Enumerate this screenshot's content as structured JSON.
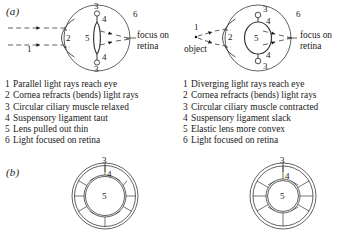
{
  "figure": {
    "panels": {
      "a": {
        "label": "(a)"
      },
      "b": {
        "label": "(b)"
      }
    }
  },
  "diagrams": {
    "eye_relaxed": {
      "name": "distant-vision-eye",
      "annotations": {
        "ray_label": "1",
        "cornea_label": "2",
        "ciliary_top_label": "3",
        "ciliary_bottom_label": "3",
        "ligament_top_label": "4",
        "ligament_bottom_label": "4",
        "lens_label": "5",
        "retina_label": "6"
      },
      "focus_text_line1": "focus on",
      "focus_text_line2": "retina"
    },
    "eye_accommodated": {
      "name": "near-vision-eye",
      "annotations": {
        "ray_label": "1",
        "cornea_label": "2",
        "ciliary_top_label": "3",
        "ciliary_bottom_label": "3",
        "ligament_top_label": "4",
        "ligament_bottom_label": "4",
        "lens_label": "5",
        "retina_label": "6"
      },
      "object_text": "object",
      "focus_text_line1": "focus on",
      "focus_text_line2": "retina"
    },
    "ciliary_relaxed": {
      "name": "ciliary-ring-relaxed",
      "annotations": {
        "muscle_label": "3",
        "ligament_label": "4",
        "lens_label": "5"
      }
    },
    "ciliary_contracted": {
      "name": "ciliary-ring-contracted",
      "annotations": {
        "muscle_label": "3",
        "ligament_label": "4",
        "lens_label": "5"
      }
    }
  },
  "captions": {
    "left": [
      {
        "num": "1",
        "text": "Parallel light rays reach eye"
      },
      {
        "num": "2",
        "text": "Cornea refracts (bends) light rays"
      },
      {
        "num": "3",
        "text": "Circular ciliary muscle relaxed"
      },
      {
        "num": "4",
        "text": "Suspensory ligament taut"
      },
      {
        "num": "5",
        "text": "Lens pulled out thin"
      },
      {
        "num": "6",
        "text": "Light focused on retina"
      }
    ],
    "right": [
      {
        "num": "1",
        "text": "Diverging light rays reach eye"
      },
      {
        "num": "2",
        "text": "Cornea refracts (bends) light rays"
      },
      {
        "num": "3",
        "text": "Circular ciliary muscle contracted"
      },
      {
        "num": "4",
        "text": "Suspensory ligament slack"
      },
      {
        "num": "5",
        "text": "Elastic lens more convex"
      },
      {
        "num": "6",
        "text": "Light focused on retina"
      }
    ]
  },
  "colors": {
    "ink": "#1a1a1a",
    "line": "#3a3a3a",
    "background": "#ffffff"
  }
}
